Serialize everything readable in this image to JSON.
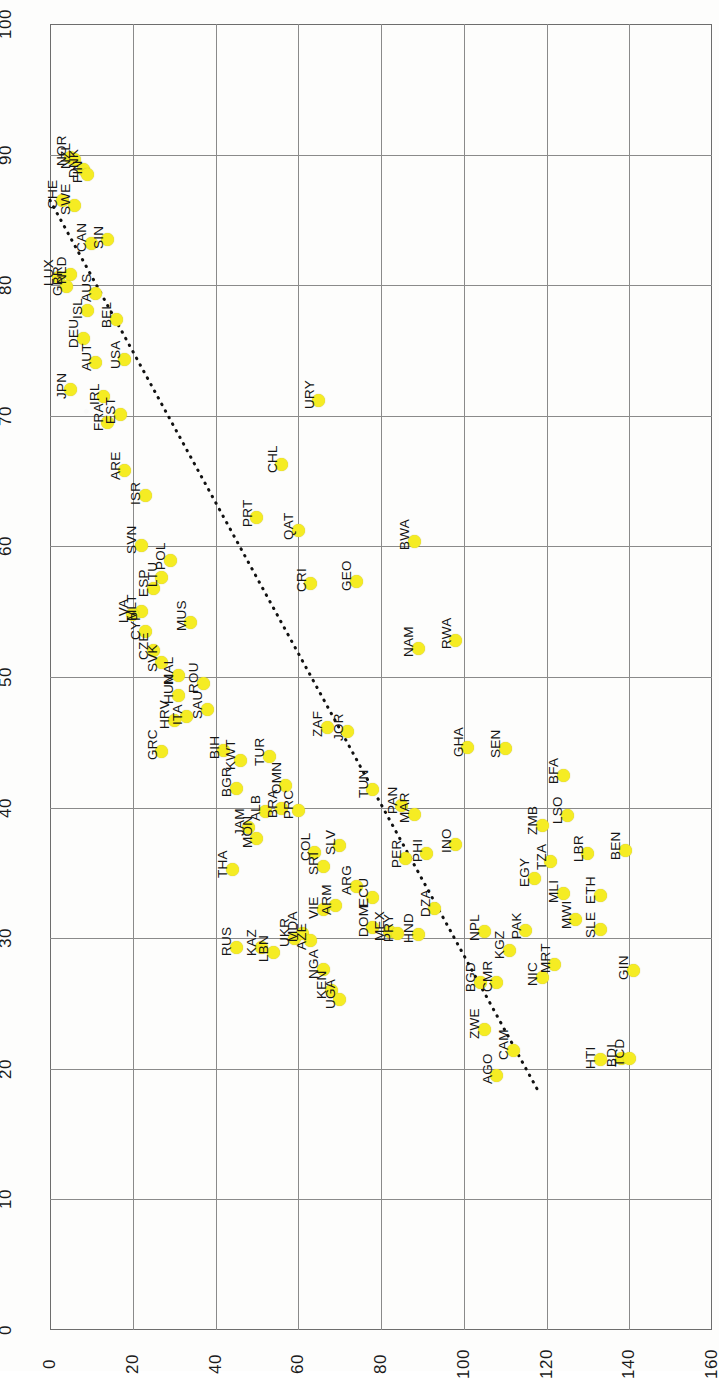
{
  "chart_data": {
    "type": "scatter",
    "title": "",
    "subtitle": "",
    "xlabel": "",
    "ylabel": "",
    "xlim": [
      0,
      160
    ],
    "ylim": [
      0,
      100
    ],
    "xticks": [
      "0",
      "20",
      "40",
      "60",
      "80",
      "100",
      "120",
      "140",
      "160"
    ],
    "yticks": [
      "0",
      "10",
      "20",
      "30",
      "40",
      "50",
      "60",
      "70",
      "80",
      "90",
      "100"
    ],
    "grid": true,
    "legend": "none",
    "marker_color": "#f5ec23",
    "marker_shape": "circle",
    "trendline": {
      "style": "dotted",
      "color": "#111111",
      "x_start": 0,
      "y_start": 86.5,
      "x_end": 118,
      "y_end": 18.3
    },
    "point_label_field": "country_code",
    "points": [
      {
        "label": "NOR",
        "x": 5,
        "y": 89.8
      },
      {
        "label": "NZL",
        "x": 6,
        "y": 89.6
      },
      {
        "label": "DNK",
        "x": 8,
        "y": 88.9
      },
      {
        "label": "FIN",
        "x": 9,
        "y": 88.5
      },
      {
        "label": "CHE",
        "x": 3,
        "y": 86.5
      },
      {
        "label": "SWE",
        "x": 6,
        "y": 86.1
      },
      {
        "label": "CAN",
        "x": 10,
        "y": 83.2
      },
      {
        "label": "SIN",
        "x": 14,
        "y": 83.5
      },
      {
        "label": "LUX",
        "x": 2,
        "y": 80.6
      },
      {
        "label": "NLD",
        "x": 5,
        "y": 80.8
      },
      {
        "label": "AUS",
        "x": 11,
        "y": 79.4
      },
      {
        "label": "GBR",
        "x": 4,
        "y": 79.9
      },
      {
        "label": "ISL",
        "x": 9,
        "y": 78.1
      },
      {
        "label": "BEL",
        "x": 16,
        "y": 77.4
      },
      {
        "label": "DEU",
        "x": 8,
        "y": 75.9
      },
      {
        "label": "USA",
        "x": 18,
        "y": 74.3
      },
      {
        "label": "AUT",
        "x": 11,
        "y": 74.1
      },
      {
        "label": "IRL",
        "x": 13,
        "y": 71.5
      },
      {
        "label": "JPN",
        "x": 5,
        "y": 72.0
      },
      {
        "label": "FRA",
        "x": 14,
        "y": 69.5
      },
      {
        "label": "EST",
        "x": 17,
        "y": 70.1
      },
      {
        "label": "URY",
        "x": 65,
        "y": 71.2
      },
      {
        "label": "ARE",
        "x": 18,
        "y": 65.8
      },
      {
        "label": "CHL",
        "x": 56,
        "y": 66.3
      },
      {
        "label": "PRT",
        "x": 50,
        "y": 62.2
      },
      {
        "label": "ISR",
        "x": 23,
        "y": 63.9
      },
      {
        "label": "QAT",
        "x": 60,
        "y": 61.2
      },
      {
        "label": "SVN",
        "x": 22,
        "y": 60.1
      },
      {
        "label": "BWA",
        "x": 88,
        "y": 60.4
      },
      {
        "label": "POL",
        "x": 29,
        "y": 58.9
      },
      {
        "label": "LTU",
        "x": 27,
        "y": 57.6
      },
      {
        "label": "CRI",
        "x": 63,
        "y": 57.2
      },
      {
        "label": "GEO",
        "x": 74,
        "y": 57.3
      },
      {
        "label": "ESP",
        "x": 25,
        "y": 56.8
      },
      {
        "label": "MLT",
        "x": 22,
        "y": 55.0
      },
      {
        "label": "LVA",
        "x": 20,
        "y": 54.8
      },
      {
        "label": "CYP",
        "x": 23,
        "y": 53.5
      },
      {
        "label": "MUS",
        "x": 34,
        "y": 54.2
      },
      {
        "label": "CZE",
        "x": 25,
        "y": 52.0
      },
      {
        "label": "RWA",
        "x": 98,
        "y": 52.8
      },
      {
        "label": "SVK",
        "x": 27,
        "y": 51.1
      },
      {
        "label": "NAM",
        "x": 89,
        "y": 52.2
      },
      {
        "label": "MAL",
        "x": 31,
        "y": 50.1
      },
      {
        "label": "ROU",
        "x": 37,
        "y": 49.5
      },
      {
        "label": "HUN",
        "x": 31,
        "y": 48.6
      },
      {
        "label": "ITA",
        "x": 33,
        "y": 47.0
      },
      {
        "label": "HRV",
        "x": 30,
        "y": 46.7
      },
      {
        "label": "SAU",
        "x": 38,
        "y": 47.5
      },
      {
        "label": "ZAF",
        "x": 67,
        "y": 46.1
      },
      {
        "label": "JOR",
        "x": 72,
        "y": 45.8
      },
      {
        "label": "GRC",
        "x": 27,
        "y": 44.3
      },
      {
        "label": "BIH",
        "x": 42,
        "y": 44.4
      },
      {
        "label": "KWT",
        "x": 46,
        "y": 43.6
      },
      {
        "label": "TUR",
        "x": 53,
        "y": 43.9
      },
      {
        "label": "OMN",
        "x": 57,
        "y": 41.7
      },
      {
        "label": "BGR",
        "x": 45,
        "y": 41.5
      },
      {
        "label": "GHA",
        "x": 101,
        "y": 44.6
      },
      {
        "label": "SEN",
        "x": 110,
        "y": 44.5
      },
      {
        "label": "BFA",
        "x": 124,
        "y": 42.5
      },
      {
        "label": "TUN",
        "x": 78,
        "y": 41.4
      },
      {
        "label": "PAN",
        "x": 85,
        "y": 40.2
      },
      {
        "label": "ALB",
        "x": 52,
        "y": 39.7
      },
      {
        "label": "BRA",
        "x": 56,
        "y": 39.9
      },
      {
        "label": "PRC",
        "x": 60,
        "y": 39.8
      },
      {
        "label": "MAR",
        "x": 88,
        "y": 39.5
      },
      {
        "label": "JAM",
        "x": 48,
        "y": 38.5
      },
      {
        "label": "MON",
        "x": 50,
        "y": 37.6
      },
      {
        "label": "ZMB",
        "x": 119,
        "y": 38.6
      },
      {
        "label": "LSO",
        "x": 125,
        "y": 39.4
      },
      {
        "label": "SLV",
        "x": 70,
        "y": 37.1
      },
      {
        "label": "PER",
        "x": 86,
        "y": 36.1
      },
      {
        "label": "PHI",
        "x": 91,
        "y": 36.5
      },
      {
        "label": "BEN",
        "x": 139,
        "y": 36.7
      },
      {
        "label": "COL",
        "x": 64,
        "y": 36.6
      },
      {
        "label": "TZA",
        "x": 121,
        "y": 35.9
      },
      {
        "label": "LBR",
        "x": 130,
        "y": 36.5
      },
      {
        "label": "SRI",
        "x": 66,
        "y": 35.5
      },
      {
        "label": "THA",
        "x": 44,
        "y": 35.3
      },
      {
        "label": "INO",
        "x": 98,
        "y": 37.2
      },
      {
        "label": "ARG",
        "x": 74,
        "y": 34.0
      },
      {
        "label": "ECU",
        "x": 78,
        "y": 33.1
      },
      {
        "label": "EGY",
        "x": 117,
        "y": 34.6
      },
      {
        "label": "VIE",
        "x": 66,
        "y": 32.2
      },
      {
        "label": "ARM",
        "x": 69,
        "y": 32.5
      },
      {
        "label": "ETH",
        "x": 133,
        "y": 33.3
      },
      {
        "label": "MLI",
        "x": 124,
        "y": 33.4
      },
      {
        "label": "DZA",
        "x": 93,
        "y": 32.3
      },
      {
        "label": "MWI",
        "x": 127,
        "y": 31.4
      },
      {
        "label": "DOM",
        "x": 78,
        "y": 30.8
      },
      {
        "label": "MEX",
        "x": 82,
        "y": 30.5
      },
      {
        "label": "PRY",
        "x": 84,
        "y": 30.4
      },
      {
        "label": "HND",
        "x": 89,
        "y": 30.3
      },
      {
        "label": "PAK",
        "x": 115,
        "y": 30.6
      },
      {
        "label": "SLE",
        "x": 133,
        "y": 30.7
      },
      {
        "label": "NPL",
        "x": 105,
        "y": 30.5
      },
      {
        "label": "RUS",
        "x": 45,
        "y": 29.3
      },
      {
        "label": "KAZ",
        "x": 51,
        "y": 29.3
      },
      {
        "label": "UKR",
        "x": 59,
        "y": 30.0
      },
      {
        "label": "MDA",
        "x": 61,
        "y": 30.4
      },
      {
        "label": "AZE",
        "x": 63,
        "y": 29.8
      },
      {
        "label": "LBN",
        "x": 54,
        "y": 28.9
      },
      {
        "label": "KGZ",
        "x": 111,
        "y": 29.1
      },
      {
        "label": "NIC",
        "x": 119,
        "y": 27.0
      },
      {
        "label": "MRT",
        "x": 122,
        "y": 28.0
      },
      {
        "label": "GIN",
        "x": 141,
        "y": 27.5
      },
      {
        "label": "NGA",
        "x": 66,
        "y": 27.6
      },
      {
        "label": "BGD",
        "x": 104,
        "y": 26.6
      },
      {
        "label": "CMR",
        "x": 108,
        "y": 26.6
      },
      {
        "label": "KEN",
        "x": 68,
        "y": 26.0
      },
      {
        "label": "ZWE",
        "x": 105,
        "y": 23.0
      },
      {
        "label": "UGA",
        "x": 70,
        "y": 25.3
      },
      {
        "label": "CAM",
        "x": 112,
        "y": 21.4
      },
      {
        "label": "AGO",
        "x": 108,
        "y": 19.5
      },
      {
        "label": "HTI",
        "x": 133,
        "y": 20.7
      },
      {
        "label": "BDI",
        "x": 138,
        "y": 20.8
      },
      {
        "label": "TCD",
        "x": 140,
        "y": 20.8
      }
    ]
  }
}
